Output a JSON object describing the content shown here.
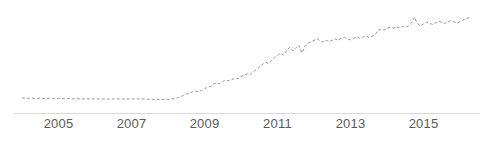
{
  "chart_data": {
    "type": "line",
    "title": "",
    "subtitle": "",
    "xlabel": "",
    "ylabel": "",
    "grid": false,
    "legend": null,
    "legend_position": "none",
    "line_style": "dashed",
    "line_color": "#999999",
    "axis_color": "#d9d9d9",
    "tick_label_color": "#5a5a5a",
    "xlim": [
      2004.0,
      2016.3
    ],
    "ylim": [
      0,
      100
    ],
    "x_tick_labels": [
      "2005",
      "2007",
      "2009",
      "2011",
      "2013",
      "2015"
    ],
    "x_tick_values": [
      2005,
      2007,
      2009,
      2011,
      2013,
      2015
    ],
    "y_tick_labels": [],
    "x": [
      2004.0,
      2004.08,
      2004.17,
      2004.25,
      2004.33,
      2004.42,
      2004.5,
      2004.58,
      2004.67,
      2004.75,
      2004.83,
      2004.92,
      2005.0,
      2005.08,
      2005.17,
      2005.25,
      2005.33,
      2005.42,
      2005.5,
      2005.58,
      2005.67,
      2005.75,
      2005.83,
      2005.92,
      2006.0,
      2006.08,
      2006.17,
      2006.25,
      2006.33,
      2006.42,
      2006.5,
      2006.58,
      2006.67,
      2006.75,
      2006.83,
      2006.92,
      2007.0,
      2007.08,
      2007.17,
      2007.25,
      2007.33,
      2007.42,
      2007.5,
      2007.58,
      2007.67,
      2007.75,
      2007.83,
      2007.92,
      2008.0,
      2008.08,
      2008.17,
      2008.25,
      2008.33,
      2008.42,
      2008.5,
      2008.58,
      2008.67,
      2008.75,
      2008.83,
      2008.92,
      2009.0,
      2009.08,
      2009.17,
      2009.25,
      2009.33,
      2009.42,
      2009.5,
      2009.58,
      2009.67,
      2009.75,
      2009.83,
      2009.92,
      2010.0,
      2010.08,
      2010.17,
      2010.25,
      2010.33,
      2010.42,
      2010.5,
      2010.58,
      2010.67,
      2010.75,
      2010.83,
      2010.92,
      2011.0,
      2011.08,
      2011.17,
      2011.25,
      2011.33,
      2011.42,
      2011.5,
      2011.58,
      2011.67,
      2011.75,
      2011.83,
      2011.92,
      2012.0,
      2012.08,
      2012.17,
      2012.25,
      2012.33,
      2012.42,
      2012.5,
      2012.58,
      2012.67,
      2012.75,
      2012.83,
      2012.92,
      2013.0,
      2013.08,
      2013.17,
      2013.25,
      2013.33,
      2013.42,
      2013.5,
      2013.58,
      2013.67,
      2013.75,
      2013.83,
      2013.92,
      2014.0,
      2014.08,
      2014.17,
      2014.25,
      2014.33,
      2014.42,
      2014.5,
      2014.58,
      2014.67,
      2014.75,
      2014.83,
      2014.92,
      2015.0,
      2015.08,
      2015.17,
      2015.25,
      2015.33,
      2015.42,
      2015.5,
      2015.58,
      2015.67,
      2015.75,
      2015.83,
      2015.92,
      2016.0,
      2016.08,
      2016.17,
      2016.25
    ],
    "values": [
      8.5,
      8.2,
      8.0,
      8.3,
      8.1,
      7.9,
      8.2,
      8.0,
      7.8,
      8.1,
      7.9,
      7.7,
      7.9,
      7.7,
      7.5,
      7.8,
      7.6,
      7.4,
      7.7,
      7.5,
      7.3,
      7.6,
      7.4,
      7.2,
      7.5,
      7.3,
      7.5,
      7.2,
      7.4,
      7.1,
      7.3,
      7.5,
      7.2,
      7.4,
      7.1,
      7.3,
      7.6,
      7.3,
      7.5,
      7.2,
      7.4,
      7.0,
      7.2,
      6.9,
      7.1,
      6.8,
      7.0,
      6.7,
      6.9,
      7.2,
      7.6,
      8.4,
      9.5,
      11.0,
      12.5,
      13.0,
      14.8,
      15.5,
      14.9,
      16.2,
      17.8,
      19.5,
      20.5,
      22.8,
      24.0,
      23.2,
      25.5,
      26.8,
      26.2,
      27.5,
      29.0,
      28.4,
      30.5,
      32.0,
      33.5,
      32.8,
      35.5,
      38.0,
      40.5,
      43.0,
      45.5,
      44.5,
      47.0,
      50.5,
      52.5,
      55.0,
      53.0,
      58.0,
      61.0,
      57.5,
      60.5,
      63.5,
      55.5,
      62.0,
      65.5,
      67.0,
      68.5,
      70.0,
      68.0,
      66.5,
      68.5,
      67.0,
      68.5,
      70.0,
      68.5,
      70.5,
      71.5,
      70.0,
      69.0,
      70.5,
      72.0,
      70.5,
      71.5,
      73.0,
      71.5,
      72.5,
      74.0,
      78.5,
      80.0,
      79.0,
      80.5,
      82.0,
      81.0,
      82.5,
      81.5,
      83.0,
      82.0,
      83.5,
      86.5,
      92.5,
      86.0,
      83.5,
      85.5,
      87.5,
      86.0,
      85.0,
      86.5,
      88.5,
      87.0,
      86.0,
      87.5,
      89.0,
      87.5,
      86.5,
      88.0,
      89.5,
      91.0,
      92.0
    ]
  },
  "axis": {
    "label_2005": "2005",
    "label_2007": "2007",
    "label_2009": "2009",
    "label_2011": "2011",
    "label_2013": "2013",
    "label_2015": "2015"
  }
}
